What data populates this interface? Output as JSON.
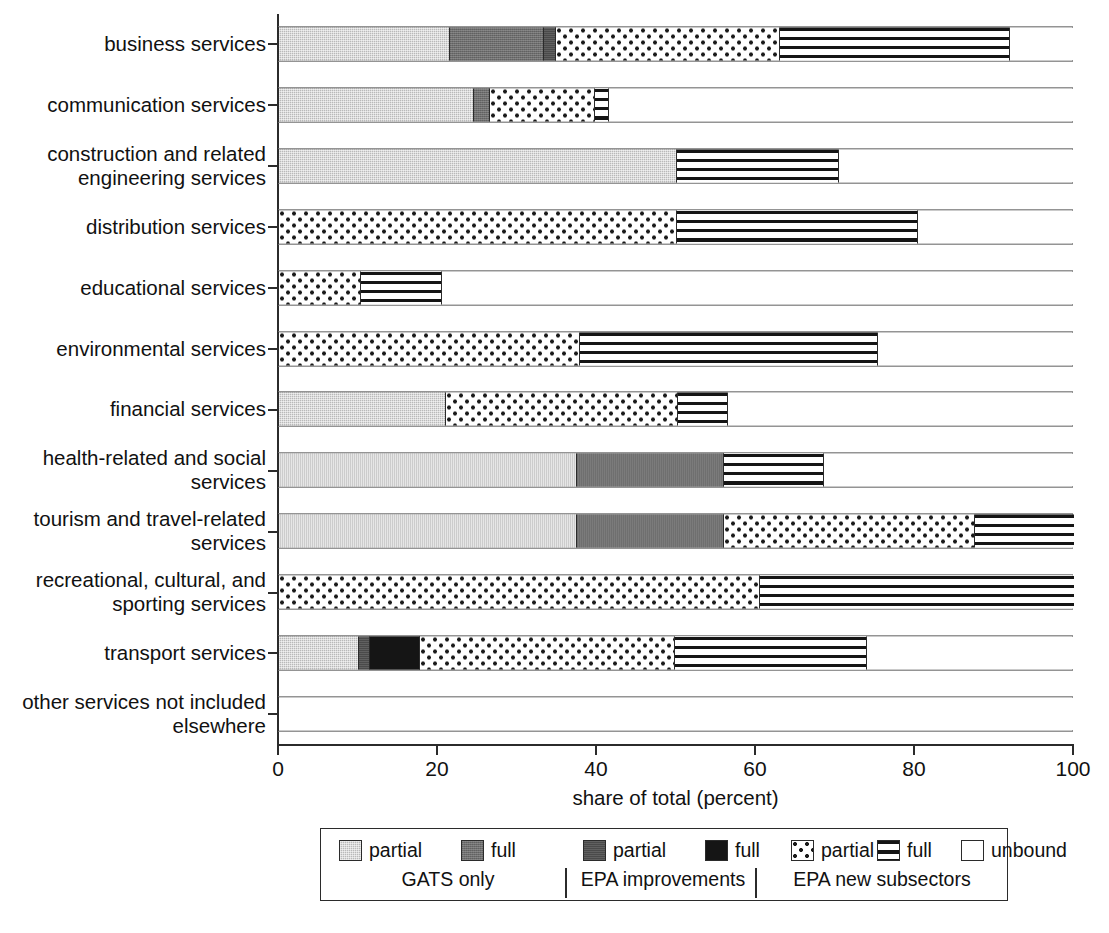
{
  "chart_data": {
    "type": "bar",
    "subtype": "horizontal stacked bar",
    "title": "",
    "xlabel": "share of total (percent)",
    "ylabel": "",
    "xlim": [
      0,
      100
    ],
    "xticks": [
      0,
      20,
      40,
      60,
      80,
      100
    ],
    "grid": false,
    "legend_position": "bottom",
    "categories": [
      "business services",
      "communication services",
      "construction and related\nengineering services",
      "distribution services",
      "educational services",
      "environmental services",
      "financial services",
      "health-related and social\nservices",
      "tourism and travel-related\nservices",
      "recreational, cultural, and\nsporting services",
      "transport services",
      "other services not included\nelsewhere"
    ],
    "series": [
      {
        "name": "GATS only partial",
        "key": "gats_partial",
        "pattern": "light-gray",
        "values": [
          21.5,
          24.5,
          50.0,
          0.0,
          0.0,
          0.0,
          21.0,
          37.5,
          37.5,
          0.0,
          10.0,
          0.0
        ]
      },
      {
        "name": "GATS only full",
        "key": "gats_full",
        "pattern": "medium-gray",
        "values": [
          11.8,
          2.0,
          0.0,
          0.0,
          0.0,
          0.0,
          0.0,
          18.5,
          18.5,
          0.0,
          0.0,
          0.0
        ]
      },
      {
        "name": "EPA improvements partial",
        "key": "epa_partial",
        "pattern": "dark-gray",
        "values": [
          1.5,
          0.0,
          0.0,
          0.0,
          0.0,
          0.0,
          0.0,
          0.0,
          0.0,
          0.0,
          1.5,
          0.0
        ]
      },
      {
        "name": "EPA improvements full",
        "key": "epa_full",
        "pattern": "black",
        "values": [
          0.0,
          0.0,
          0.0,
          0.0,
          0.0,
          0.0,
          0.0,
          0.0,
          0.0,
          0.0,
          6.2,
          0.0
        ]
      },
      {
        "name": "EPA new subsectors partial",
        "key": "new_partial",
        "pattern": "dotted",
        "values": [
          28.2,
          13.2,
          0.0,
          50.0,
          10.3,
          37.8,
          29.2,
          0.0,
          31.5,
          60.5,
          32.1,
          0.0
        ]
      },
      {
        "name": "EPA new subsectors full",
        "key": "new_full",
        "pattern": "horiz-stripes",
        "values": [
          29.0,
          1.8,
          20.5,
          30.4,
          10.2,
          37.5,
          6.3,
          12.5,
          12.5,
          39.5,
          24.2,
          0.0
        ]
      },
      {
        "name": "unbound",
        "key": "unbound",
        "pattern": "white",
        "values": [
          8.0,
          58.5,
          29.5,
          19.6,
          79.5,
          24.7,
          43.5,
          31.5,
          0.0,
          0.0,
          26.0,
          100.0
        ]
      }
    ]
  },
  "axis": {
    "x_title": "share of total (percent)",
    "tick_labels": [
      "0",
      "20",
      "40",
      "60",
      "80",
      "100"
    ]
  },
  "legend": {
    "items": [
      {
        "label": "partial",
        "pattern": "light-gray"
      },
      {
        "label": "full",
        "pattern": "medium-gray"
      },
      {
        "label": "partial",
        "pattern": "dark-gray"
      },
      {
        "label": "full",
        "pattern": "black"
      },
      {
        "label": "partial",
        "pattern": "dotted"
      },
      {
        "label": "full",
        "pattern": "horiz-stripes"
      },
      {
        "label": "unbound",
        "pattern": "white"
      }
    ],
    "groups": [
      {
        "label": "GATS only"
      },
      {
        "label": "EPA improvements"
      },
      {
        "label": "EPA new subsectors"
      }
    ]
  },
  "colors": {
    "outline": "#2b2b2b",
    "gats_partial": "#b9b9b9",
    "gats_full": "#6e6e6e",
    "epa_partial": "#4a4a4a",
    "epa_full": "#151515",
    "new_pattern_ink": "#1a1a1a",
    "unbound": "#ffffff"
  }
}
